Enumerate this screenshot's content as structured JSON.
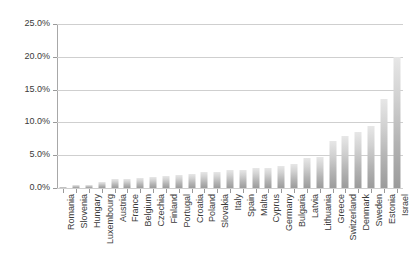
{
  "chart_data": {
    "type": "bar",
    "title": "",
    "subtitle": "",
    "xlabel": "",
    "ylabel": "",
    "ylim": [
      0,
      25
    ],
    "ytick_labels": [
      "25.0%",
      "20.0%",
      "15.0%",
      "10.0%",
      "5.0%",
      "0.0%"
    ],
    "ytick_values": [
      25,
      20,
      15,
      10,
      5,
      0
    ],
    "grid": true,
    "legend": false,
    "legend_position": "none",
    "value_suffix": "%",
    "categories": [
      "Romania",
      "Slovenia",
      "Hungary",
      "Luxembourg",
      "Austria",
      "France",
      "Belgium",
      "Czechia",
      "Finland",
      "Portugal",
      "Croatia",
      "Poland",
      "Slovakia",
      "Italy",
      "Spain",
      "Malta",
      "Cyprus",
      "Germany",
      "Bulgaria",
      "Latvia",
      "Lithuania",
      "Greece",
      "Switzerland",
      "Denmark",
      "Sweden",
      "Estonia",
      "Israel"
    ],
    "values": [
      0.1,
      0.4,
      0.5,
      0.9,
      1.3,
      1.4,
      1.6,
      1.7,
      1.9,
      2.0,
      2.1,
      2.4,
      2.5,
      2.7,
      2.8,
      3.0,
      3.1,
      3.3,
      3.6,
      4.6,
      4.7,
      7.2,
      8.0,
      8.6,
      9.5,
      13.5,
      20.0
    ]
  },
  "colors": {
    "bar_top": "#e7e7e7",
    "bar_bottom": "#9b9b9b",
    "gridline": "#cfcfcf",
    "axis": "#a8a8a8",
    "text": "#3a3a3a",
    "background": "#ffffff"
  }
}
